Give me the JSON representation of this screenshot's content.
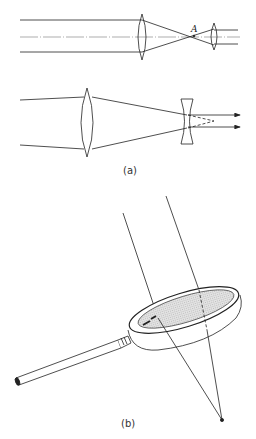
{
  "figure": {
    "panel_a": {
      "caption": "(a)",
      "point_label": "A",
      "top_diagram": "Keplerian telescope: objective converging lens focuses parallel rays to point A, eyepiece lens recollimates",
      "bottom_diagram": "Galilean telescope: converging objective lens and diverging eyepiece producing parallel output rays"
    },
    "panel_b": {
      "caption": "(b)",
      "diagram": "Magnifying glass focusing two rays to a point below the lens"
    },
    "colors": {
      "line": "#222222",
      "lens_fill": "#d8d8d8",
      "background": "#ffffff"
    }
  }
}
